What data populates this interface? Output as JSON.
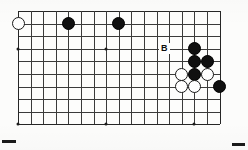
{
  "figure": {
    "kind": "go-board-diagram",
    "width": 248,
    "height": 150,
    "background_color": "#ffffff"
  },
  "board": {
    "plate_color": "#fdfdfc",
    "line_color": "#3b3b3b",
    "edge_color": "#262626",
    "left": 18,
    "top": 11,
    "cell_size": 12.6,
    "columns": 17,
    "rows": 10,
    "description": "Partial go board, cropped view of upper-right quadrant region"
  },
  "star_points": {
    "color": "#1c1c1c",
    "points": [
      {
        "col": 0,
        "row": 3,
        "name": "star-point-left-upper"
      },
      {
        "col": 0,
        "row": 9,
        "name": "star-point-left-lower"
      },
      {
        "col": 7,
        "row": 3,
        "name": "star-point-center-upper"
      },
      {
        "col": 7,
        "row": 9,
        "name": "star-point-center-lower"
      },
      {
        "col": 14,
        "row": 3,
        "name": "star-point-right-upper"
      },
      {
        "col": 14,
        "row": 9,
        "name": "star-point-right-lower"
      }
    ]
  },
  "stones": {
    "black_color": "#101010",
    "white_color": "#fefefe",
    "diameter": 13,
    "list": [
      {
        "color": "white",
        "col": 0,
        "row": 1,
        "name": "stone-white-1"
      },
      {
        "color": "black",
        "col": 4,
        "row": 1,
        "name": "stone-black-1"
      },
      {
        "color": "black",
        "col": 8,
        "row": 1,
        "name": "stone-black-2"
      },
      {
        "color": "black",
        "col": 14,
        "row": 3,
        "name": "stone-black-3"
      },
      {
        "color": "black",
        "col": 14,
        "row": 4,
        "name": "stone-black-4"
      },
      {
        "color": "black",
        "col": 15,
        "row": 4,
        "name": "stone-black-5"
      },
      {
        "color": "white",
        "col": 13,
        "row": 5,
        "name": "stone-white-2"
      },
      {
        "color": "black",
        "col": 14,
        "row": 5,
        "name": "stone-black-6"
      },
      {
        "color": "white",
        "col": 15,
        "row": 5,
        "name": "stone-white-3"
      },
      {
        "color": "white",
        "col": 13,
        "row": 6,
        "name": "stone-white-4"
      },
      {
        "color": "white",
        "col": 14,
        "row": 6,
        "name": "stone-white-5"
      },
      {
        "color": "black",
        "col": 16,
        "row": 6,
        "name": "stone-black-7"
      }
    ]
  },
  "labels": [
    {
      "text": "B",
      "col": 11.6,
      "row": 3,
      "name": "point-label-b",
      "color": "#0d0d0d"
    }
  ],
  "register_marks": [
    {
      "name": "register-mark-bottom-left",
      "left": 2,
      "top": 140,
      "width": 14,
      "height": 3
    },
    {
      "name": "register-mark-bottom-right",
      "left": 232,
      "top": 143,
      "width": 13,
      "height": 3
    }
  ]
}
